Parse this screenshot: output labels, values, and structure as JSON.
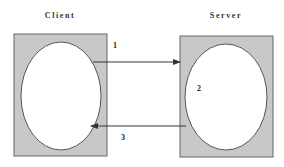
{
  "diagram": {
    "nodes": [
      {
        "id": "client",
        "label": "Client"
      },
      {
        "id": "server",
        "label": "Server"
      }
    ],
    "steps": [
      {
        "label": "1",
        "from": "client",
        "to": "server"
      },
      {
        "label": "2",
        "at": "server"
      },
      {
        "label": "3",
        "from": "server",
        "to": "client"
      }
    ],
    "colors": {
      "box_fill": "#c8c8c8",
      "box_stroke": "#666666",
      "ellipse_fill": "#ffffff",
      "arrow": "#333333"
    }
  }
}
